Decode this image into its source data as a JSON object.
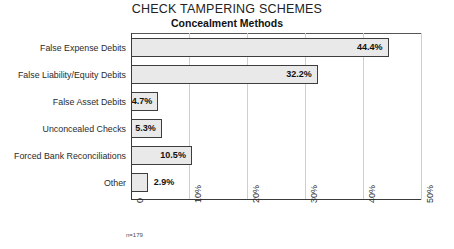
{
  "chart_data": {
    "type": "bar",
    "orientation": "horizontal",
    "title": "CHECK TAMPERING SCHEMES",
    "subtitle": "Concealment Methods",
    "xlabel": "",
    "ylabel": "",
    "xlim": [
      0,
      50
    ],
    "grid": true,
    "legend": null,
    "footnote": "n=179",
    "categories": [
      "False Expense Debits",
      "False Liability/Equity Debits",
      "False Asset Debits",
      "Unconcealed Checks",
      "Forced Bank Reconciliations",
      "Other"
    ],
    "values": [
      44.4,
      32.2,
      4.7,
      5.3,
      10.5,
      2.9
    ],
    "value_labels": [
      "44.4%",
      "32.2%",
      "4.7%",
      "5.3%",
      "10.5%",
      "2.9%"
    ],
    "label_placement": [
      "inside",
      "inside",
      "inside",
      "inside",
      "inside",
      "outside"
    ],
    "xticks": [
      0,
      10,
      20,
      30,
      40,
      50
    ],
    "xtick_labels": [
      "0",
      "10%",
      "20%",
      "30%",
      "40%",
      "50%"
    ]
  },
  "colors": {
    "bar_fill": "#e9e9e9",
    "bar_border": "#3d3d3d",
    "gridline": "#cfcfcf",
    "axis": "#3a3a3a",
    "text": "#1a1a1a",
    "background": "#ffffff"
  }
}
